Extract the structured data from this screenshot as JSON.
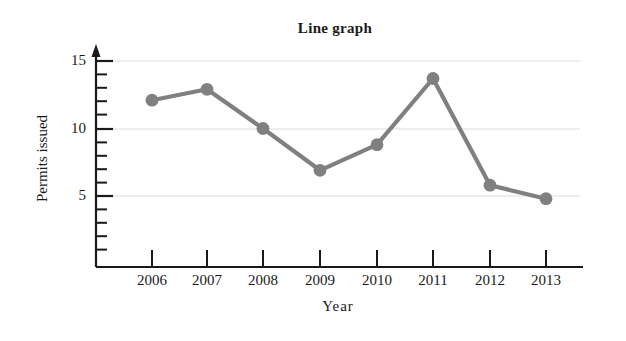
{
  "chart_data": {
    "type": "line",
    "title": "Line graph",
    "xlabel": "Year",
    "ylabel": "Permits issued",
    "categories": [
      "2006",
      "2007",
      "2008",
      "2009",
      "2010",
      "2011",
      "2012",
      "2013"
    ],
    "values": [
      12.1,
      12.9,
      10.0,
      6.9,
      8.8,
      13.7,
      5.8,
      4.8
    ],
    "series": [
      {
        "name": "Permits issued",
        "values": [
          12.1,
          12.9,
          10.0,
          6.9,
          8.8,
          13.7,
          5.8,
          4.8
        ]
      }
    ],
    "ylim": [
      0,
      15.8
    ],
    "xlim": [
      "2006",
      "2013"
    ],
    "y_major_ticks": [
      5,
      10,
      15
    ],
    "y_major_tick_labels": [
      "5",
      "10",
      "15"
    ],
    "y_minor_tick_step": 1,
    "grid": "horizontal-major-only",
    "legend": "none",
    "line_color": "#808080",
    "marker_color": "#808080",
    "marker_shape": "circle",
    "axis_color": "#1a1a1a",
    "gridline_color": "#d8d8d8",
    "background_color": "#ffffff",
    "y_axis_has_arrow": true
  },
  "axes": {
    "y_tick_labels": [
      "15",
      "10",
      "5"
    ],
    "x_tick_labels": [
      "2006",
      "2007",
      "2008",
      "2009",
      "2010",
      "2011",
      "2012",
      "2013"
    ]
  }
}
